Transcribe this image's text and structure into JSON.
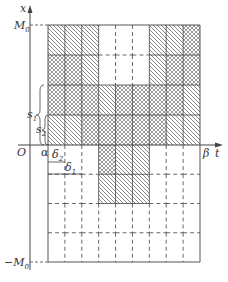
{
  "diagram": {
    "axes": {
      "x_axis_label": "t",
      "y_axis_label": "x",
      "origin_label": "O",
      "y_top_label": "M",
      "y_top_sub": "0",
      "y_bottom_label": "−M",
      "y_bottom_sub": "0",
      "t_start_label": "α",
      "t_end_label": "β"
    },
    "annotations": {
      "s1": {
        "label": "s",
        "sub": "1"
      },
      "s2": {
        "label": "s",
        "sub": "2"
      },
      "delta1": {
        "label": "δ",
        "sub": "1"
      },
      "delta2": {
        "label": "δ",
        "sub": "2"
      }
    },
    "grid": {
      "columns": 9,
      "rows": 8,
      "axis_row_index": 4,
      "legend": {
        "diag": "single diagonal hatch",
        "cross": "cross hatch",
        "empty": "no hatch"
      },
      "cells": [
        [
          "diag",
          "diag",
          "diag",
          "empty",
          "empty",
          "empty",
          "diag",
          "diag",
          "cross"
        ],
        [
          "cross",
          "cross",
          "diag",
          "empty",
          "empty",
          "empty",
          "diag",
          "cross",
          "cross"
        ],
        [
          "cross",
          "cross",
          "cross",
          "diag",
          "cross",
          "cross",
          "cross",
          "cross",
          "diag"
        ],
        [
          "diag",
          "diag",
          "cross",
          "cross",
          "cross",
          "cross",
          "cross",
          "diag",
          "diag"
        ],
        [
          "empty",
          "empty",
          "empty",
          "cross",
          "diag",
          "diag",
          "empty",
          "empty",
          "empty"
        ],
        [
          "empty",
          "empty",
          "empty",
          "diag",
          "diag",
          "diag",
          "empty",
          "empty",
          "empty"
        ],
        [
          "empty",
          "empty",
          "empty",
          "empty",
          "empty",
          "empty",
          "empty",
          "empty",
          "empty"
        ],
        [
          "empty",
          "empty",
          "empty",
          "empty",
          "empty",
          "empty",
          "empty",
          "empty",
          "empty"
        ]
      ]
    },
    "colors": {
      "line": "#444444",
      "hatch": "#555555",
      "background": "#ffffff"
    }
  }
}
